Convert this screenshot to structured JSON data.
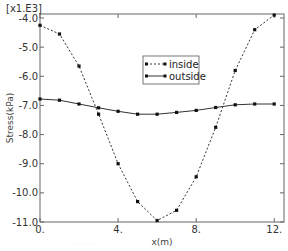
{
  "chart_data": {
    "type": "line",
    "title": "",
    "multiplier_label": "[x1.E3]",
    "xlabel": "x(m)",
    "ylabel": "Stress(kPa)",
    "xlim": [
      0,
      12.5
    ],
    "ylim": [
      -11.0,
      -3.85
    ],
    "x_ticks": [
      0,
      4,
      8,
      12
    ],
    "x_tick_labels": [
      "0.",
      "4.",
      "8.",
      "12."
    ],
    "y_ticks": [
      -4,
      -5,
      -6,
      -7,
      -8,
      -9,
      -10,
      -11
    ],
    "y_tick_labels": [
      "-4.0",
      "-5.0",
      "-6.0",
      "-7.0",
      "-8.0",
      "-9.0",
      "-10.0",
      "-11.0"
    ],
    "grid": false,
    "legend_position": "upper-center",
    "x": [
      0,
      1,
      2,
      3,
      4,
      5,
      6,
      7,
      8,
      9,
      10,
      11,
      12
    ],
    "series": [
      {
        "name": "inside",
        "style": "dashed",
        "marker": "square",
        "values": [
          -4.25,
          -4.55,
          -5.65,
          -7.3,
          -9.0,
          -10.3,
          -10.95,
          -10.6,
          -9.45,
          -7.75,
          -5.8,
          -4.4,
          -3.9
        ]
      },
      {
        "name": "outside",
        "style": "solid",
        "marker": "square",
        "values": [
          -6.78,
          -6.82,
          -6.95,
          -7.08,
          -7.2,
          -7.3,
          -7.3,
          -7.24,
          -7.17,
          -7.07,
          -6.98,
          -6.95,
          -6.95
        ]
      }
    ]
  },
  "caption": "· · · · · ·"
}
